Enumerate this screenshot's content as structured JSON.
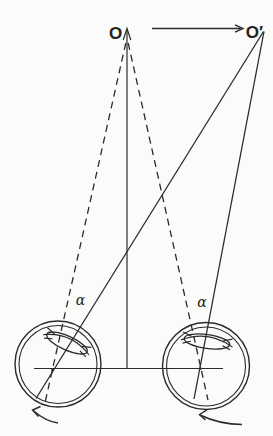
{
  "figure": {
    "kind": "binocular-eye-movement-diagram",
    "labels": {
      "initial_fixation_point": "O",
      "new_fixation_point": "O′",
      "left_eye_angle": "α",
      "right_eye_angle": "α"
    },
    "colors": {
      "ink": "#2b2b2b",
      "paper": "#fbfbf9"
    }
  }
}
